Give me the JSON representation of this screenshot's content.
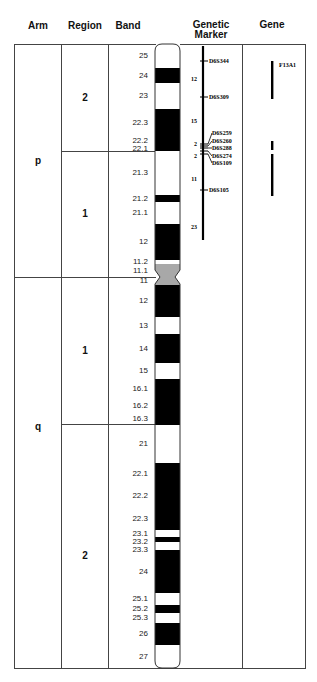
{
  "headers": {
    "arm": "Arm",
    "region": "Region",
    "band": "Band",
    "marker_line1": "Genetic",
    "marker_line2": "Marker",
    "gene": "Gene"
  },
  "arms": [
    {
      "label": "p",
      "top_band": "p25",
      "bottom_band": "p11.1"
    },
    {
      "label": "q",
      "top_band": "q11",
      "bottom_band": "q27"
    }
  ],
  "regions": [
    {
      "arm": "p",
      "label": "2"
    },
    {
      "arm": "p",
      "label": "1"
    },
    {
      "arm": "q",
      "label": "1"
    },
    {
      "arm": "q",
      "label": "2"
    }
  ],
  "bands": [
    {
      "arm": "p",
      "label": "25",
      "stain": "white",
      "start": 0.0,
      "end": 24
    },
    {
      "arm": "p",
      "label": "24",
      "stain": "black",
      "start": 24,
      "end": 39
    },
    {
      "arm": "p",
      "label": "23",
      "stain": "white",
      "start": 39,
      "end": 65
    },
    {
      "arm": "p",
      "label": "22.3",
      "stain": "black",
      "start": 65,
      "end": 93
    },
    {
      "arm": "p",
      "label": "22.2",
      "stain": "black",
      "start": 93,
      "end": 100
    },
    {
      "arm": "p",
      "label": "22.1",
      "stain": "black",
      "start": 100,
      "end": 107
    },
    {
      "arm": "p",
      "label": "21.3",
      "stain": "white",
      "start": 107,
      "end": 151
    },
    {
      "arm": "p",
      "label": "21.2",
      "stain": "black",
      "start": 151,
      "end": 158
    },
    {
      "arm": "p",
      "label": "21.1",
      "stain": "white",
      "start": 158,
      "end": 180
    },
    {
      "arm": "p",
      "label": "12",
      "stain": "black",
      "start": 180,
      "end": 216
    },
    {
      "arm": "p",
      "label": "11.2",
      "stain": "white",
      "start": 216,
      "end": 220
    },
    {
      "arm": "p",
      "label": "11.1",
      "stain": "gray",
      "start": 220,
      "end": 233
    },
    {
      "arm": "q",
      "label": "11",
      "stain": "gray",
      "start": 233,
      "end": 241
    },
    {
      "arm": "q",
      "label": "12",
      "stain": "black",
      "start": 241,
      "end": 273
    },
    {
      "arm": "q",
      "label": "13",
      "stain": "white",
      "start": 273,
      "end": 290
    },
    {
      "arm": "q",
      "label": "14",
      "stain": "black",
      "start": 290,
      "end": 319
    },
    {
      "arm": "q",
      "label": "15",
      "stain": "white",
      "start": 319,
      "end": 335
    },
    {
      "arm": "q",
      "label": "16.1",
      "stain": "black",
      "start": 335,
      "end": 355
    },
    {
      "arm": "q",
      "label": "16.2",
      "stain": "black",
      "start": 355,
      "end": 368
    },
    {
      "arm": "q",
      "label": "16.3",
      "stain": "black",
      "start": 368,
      "end": 381
    },
    {
      "arm": "q",
      "label": "21",
      "stain": "white",
      "start": 381,
      "end": 419
    },
    {
      "arm": "q",
      "label": "22.1",
      "stain": "black",
      "start": 419,
      "end": 441
    },
    {
      "arm": "q",
      "label": "22.2",
      "stain": "black",
      "start": 441,
      "end": 463
    },
    {
      "arm": "q",
      "label": "22.3",
      "stain": "black",
      "start": 463,
      "end": 486
    },
    {
      "arm": "q",
      "label": "23.1",
      "stain": "white",
      "start": 486,
      "end": 493
    },
    {
      "arm": "q",
      "label": "23.2",
      "stain": "black",
      "start": 493,
      "end": 498
    },
    {
      "arm": "q",
      "label": "23.3",
      "stain": "white",
      "start": 498,
      "end": 506
    },
    {
      "arm": "q",
      "label": "24",
      "stain": "black",
      "start": 506,
      "end": 549
    },
    {
      "arm": "q",
      "label": "25.1",
      "stain": "white",
      "start": 549,
      "end": 561
    },
    {
      "arm": "q",
      "label": "25.2",
      "stain": "black",
      "start": 561,
      "end": 569
    },
    {
      "arm": "q",
      "label": "25.3",
      "stain": "white",
      "start": 569,
      "end": 579
    },
    {
      "arm": "q",
      "label": "26",
      "stain": "black",
      "start": 579,
      "end": 601
    },
    {
      "arm": "q",
      "label": "27",
      "stain": "white",
      "start": 601,
      "end": 624
    }
  ],
  "genetic_markers": [
    {
      "name": "D6S344",
      "pos": 17
    },
    {
      "name": "D6S309",
      "pos": 53
    },
    {
      "name": "D6S259",
      "pos": 91
    },
    {
      "name": "D6S260",
      "pos": 96
    },
    {
      "name": "D6S288",
      "pos": 101
    },
    {
      "name": "D6S274",
      "pos": 106
    },
    {
      "name": "D6S109",
      "pos": 111
    },
    {
      "name": "D6S105",
      "pos": 146
    }
  ],
  "marker_distances": [
    {
      "label": "12",
      "pos": 35
    },
    {
      "label": "15",
      "pos": 77
    },
    {
      "label": "2",
      "pos": 100
    },
    {
      "label": "2",
      "pos": 112
    },
    {
      "label": "11",
      "pos": 135
    },
    {
      "label": "23",
      "pos": 183
    }
  ],
  "marker_line": {
    "start": 2,
    "end": 196
  },
  "genes": [
    {
      "name": "F13A1",
      "segments": [
        {
          "start": 17,
          "end": 55
        },
        {
          "start": 97,
          "end": 106
        },
        {
          "start": 110,
          "end": 152
        }
      ]
    }
  ],
  "colors": {
    "stain_black": "#000000",
    "stain_white": "#ffffff",
    "stain_gray": "#a8a8a8",
    "line": "#444444"
  }
}
